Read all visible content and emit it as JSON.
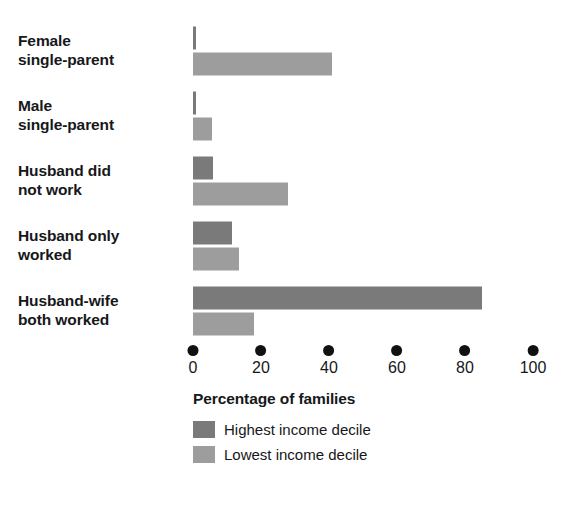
{
  "chart_data": {
    "type": "bar",
    "orientation": "horizontal",
    "title": "",
    "xlabel": "Percentage of families",
    "ylabel": "",
    "xlim": [
      0,
      100
    ],
    "xticks": [
      "0",
      "20",
      "40",
      "60",
      "80",
      "100"
    ],
    "grid": false,
    "legend_position": "below-axis-left",
    "categories": [
      "Female\nsingle-parent",
      "Male\nsingle-parent",
      "Husband did\nnot work",
      "Husband only\nworked",
      "Husband-wife\nboth worked"
    ],
    "series": [
      {
        "name": "Highest income decile",
        "color": "#7a7a7a",
        "values": [
          1,
          1,
          6,
          11.5,
          85
        ]
      },
      {
        "name": "Lowest income decile",
        "color": "#9d9d9d",
        "values": [
          41,
          5.5,
          28,
          13.5,
          18
        ]
      }
    ]
  },
  "axis": {
    "title": "Percentage of families",
    "tick_marker": "dot-marker-icon"
  },
  "colors": {
    "background": "#ffffff",
    "text": "#16181a",
    "tick_dot": "#111111",
    "series_highest": "#7a7a7a",
    "series_lowest": "#9d9d9d"
  }
}
